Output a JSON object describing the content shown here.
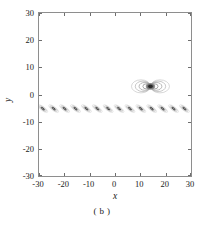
{
  "figure": {
    "caption": "( b )",
    "background": "#ffffff",
    "frame_color": "#8e8e8e"
  },
  "axes": {
    "x_title": "x",
    "y_title": "y",
    "x_ticks": [
      "-30",
      "-20",
      "-10",
      "0",
      "10",
      "20",
      "30"
    ],
    "y_ticks": [
      "30",
      "20",
      "10",
      "0",
      "-10",
      "-20",
      "-30"
    ]
  },
  "chart_data": {
    "type": "heatmap",
    "title": "",
    "subtitle": "",
    "xlabel": "x",
    "ylabel": "y",
    "xlim": [
      -30,
      30
    ],
    "ylim": [
      -30,
      30
    ],
    "xticks": [
      -30,
      -20,
      -10,
      0,
      10,
      20,
      30
    ],
    "yticks": [
      -30,
      -20,
      -10,
      0,
      10,
      20,
      30
    ],
    "grid": false,
    "legend": "none",
    "colormap": "grayscale",
    "representation": "contour lines of a scalar field",
    "annotations": [
      "( b )"
    ],
    "features": [
      {
        "name": "dipole-lobe-pair",
        "description": "Central bowtie / two-lobe contour structure with dark concentrated core",
        "center": [
          14,
          3
        ],
        "lobe_half_width": 7.5,
        "lobe_half_height": 2.4,
        "core_radius": 1.1,
        "contour_levels": 5,
        "peak_intensity": 1.0
      },
      {
        "name": "periodic-band",
        "description": "Horizontal band of repeated tilted elliptical contour blobs spanning the full x range",
        "y_center": -5.2,
        "y_half_height": 2.6,
        "x_start": -30,
        "x_end": 30,
        "blob_count": 14,
        "blob_spacing": 4.3,
        "blob_tilt_deg": -34,
        "blob_half_length": 2.3,
        "blob_half_width": 0.75,
        "contour_levels": 4,
        "peak_intensity": 0.55
      }
    ],
    "blob_centers_x": [
      -28.5,
      -24.2,
      -19.9,
      -15.6,
      -11.3,
      -7.0,
      -2.7,
      1.6,
      5.9,
      10.2,
      14.5,
      18.8,
      23.1,
      27.4
    ],
    "blob_centers_y": [
      -5.2,
      -5.2,
      -5.2,
      -5.2,
      -5.2,
      -5.2,
      -5.2,
      -5.2,
      -5.2,
      -5.2,
      -5.2,
      -5.2,
      -5.2,
      -5.2
    ]
  }
}
